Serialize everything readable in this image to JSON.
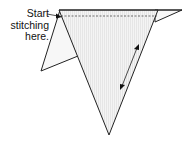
{
  "diagram": {
    "label_lines": [
      "Start",
      "stitching",
      "here."
    ],
    "colors": {
      "stroke": "#222222",
      "fill": "#f2f2f2",
      "stripe": "#d8d8d8",
      "back_fill": "#f7f7f7"
    }
  }
}
